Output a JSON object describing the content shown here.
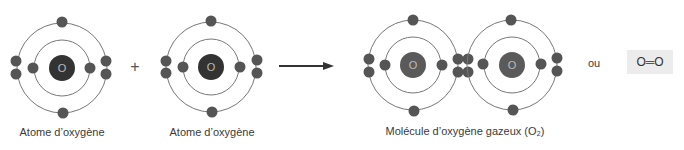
{
  "diagram": {
    "atom1": {
      "symbol": "O",
      "label": "Atome d’oxygène"
    },
    "plus": "+",
    "atom2": {
      "symbol": "O",
      "label": "Atome d’oxygène"
    },
    "molecule": {
      "symbols": [
        "O",
        "O"
      ],
      "label": "Molécule d’oxygène gazeux (O₂)"
    },
    "or_text": "ou",
    "formula": "O═O",
    "colors": {
      "electron": "#555555",
      "nucleus_atom": "#333333",
      "nucleus_molecule": "#5a5a5a",
      "orbit": "#777777",
      "formula_bg": "#ececec"
    }
  }
}
